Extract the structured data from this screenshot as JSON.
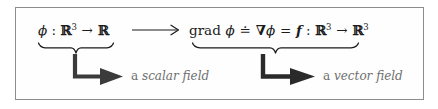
{
  "figure": {
    "kind": "math-diagram",
    "border_color": "#8d8d8d",
    "background": "#ffffff",
    "text_color": "#1b1b1b",
    "caption_color": "#6f6f6f"
  },
  "domain_expression": {
    "name": "scalar-field-expression",
    "symbol": "ϕ",
    "colon": " : ",
    "source": "ℝ",
    "source_exponent": "3",
    "arrow": "→",
    "target": "ℝ",
    "target_exponent": "",
    "plain": "ϕ : ℝ³ → ℝ"
  },
  "mapping_arrow": {
    "name": "long-right-arrow",
    "glyph": "⟶"
  },
  "codomain_expression": {
    "name": "gradient-expression",
    "operator": "grad",
    "operand": "ϕ",
    "defined_equals": "≐",
    "nabla": "∇",
    "nabla_operand": "ϕ",
    "equals": "=",
    "function_symbol": "f",
    "colon": " : ",
    "source": "ℝ",
    "source_exponent": "3",
    "arrow": "→",
    "target": "ℝ",
    "target_exponent": "3",
    "plain": "grad ϕ ≐ ∇ϕ = f : ℝ³ → ℝ³"
  },
  "braces": {
    "scalar": {
      "name": "underbrace-scalar"
    },
    "vector": {
      "name": "underbrace-vector"
    }
  },
  "callouts": [
    {
      "name": "scalar-field-callout",
      "article": "a ",
      "term": "scalar field",
      "full": "a scalar field"
    },
    {
      "name": "vector-field-callout",
      "article": "a ",
      "term": "vector field",
      "full": "a vector field"
    }
  ]
}
